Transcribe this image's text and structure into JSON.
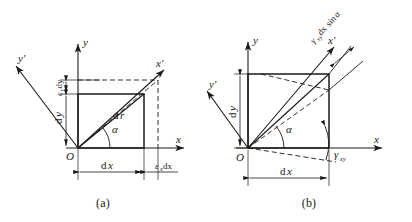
{
  "figure": {
    "type": "technical-diagram",
    "panel_count": 2,
    "line_color": "#1a1a1a",
    "background_color": "#ffffff"
  },
  "panel_a": {
    "caption": "(a)",
    "description": "Original rectangle O-dx-dy with deformed dashed rectangle extended by epsilon_x dx horizontally and epsilon_y dy vertically; line element dr at angle alpha rotates to x' axis",
    "axes": {
      "x_label": "x",
      "y_label": "y",
      "x_prime_label": "x'",
      "y_prime_label": "y'",
      "origin_label": "O"
    },
    "labels": {
      "dr": "dr",
      "dr_d": "d",
      "dr_r": "r",
      "alpha": "α",
      "dx": "dx",
      "dx_d": "d",
      "dx_x": "x",
      "dy": "dy",
      "dy_d": "d",
      "dy_y": "y",
      "eps_x_dx_symbol": "ε",
      "eps_x_dx_sub": "x",
      "eps_x_dx_rest": "dx",
      "eps_y_dy_symbol": "ε",
      "eps_y_dy_sub": "y",
      "eps_y_dy_rest": "dy"
    }
  },
  "panel_b": {
    "caption": "(b)",
    "description": "Original rectangle O-dx-dy sheared by gamma_xy; dashed parallelogram shows shear deformation, displacement gamma_xy dx sin alpha measured perpendicular to x' axis",
    "axes": {
      "x_label": "x",
      "y_label": "y",
      "x_prime_label": "x'",
      "y_prime_label": "y'",
      "origin_label": "O"
    },
    "labels": {
      "alpha": "α",
      "dx": "dx",
      "dx_d": "d",
      "dx_x": "x",
      "dy": "dy",
      "dy_d": "d",
      "dy_y": "y",
      "gamma_axis_symbol": "γ",
      "gamma_axis_sub": "xy",
      "gamma_disp_symbol": "γ",
      "gamma_disp_sub": "xy",
      "gamma_disp_rest": "dx",
      "gamma_disp_trig": "sin",
      "gamma_disp_angle": "α"
    }
  }
}
